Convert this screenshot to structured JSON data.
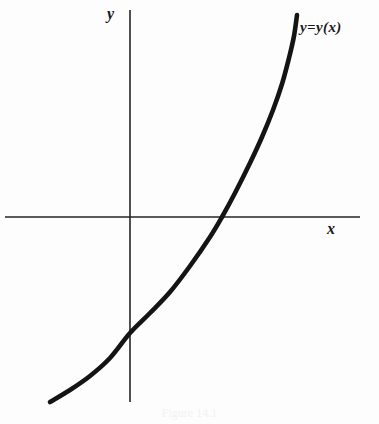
{
  "figure": {
    "background_color": "#fdfdfd",
    "ink_color": "#141414",
    "axis_color": "#242424",
    "axis_label_y": "y",
    "axis_label_x": "x",
    "curve_label": "y=y(x)",
    "caption": "Figure 14.1"
  },
  "chart_data": {
    "type": "line",
    "title": "",
    "subtitle": "",
    "xlabel": "x",
    "ylabel": "y",
    "annotations": [
      {
        "text": "y=y(x)",
        "x_px": 302,
        "y_px": 30,
        "describes": "curve"
      }
    ],
    "legend": [],
    "legend_position": "none",
    "grid": false,
    "axes": {
      "x_axis_px": {
        "y": 217,
        "x_start": 5,
        "x_end": 360
      },
      "y_axis_px": {
        "x": 130,
        "y_start": 10,
        "y_end": 402
      },
      "origin_px": {
        "x": 130,
        "y": 217
      },
      "x_axis_visible": true,
      "y_axis_visible": true,
      "tick_labels_x": [],
      "tick_labels_y": []
    },
    "series": [
      {
        "name": "y=y(x)",
        "style": "solid",
        "color": "#141414",
        "width_px": 4.6,
        "description": "Smooth monotonically increasing convex curve resembling an exponential shifted downward; negative for x below the root, crossing the x-axis once.",
        "points_px": [
          [
            50,
            402
          ],
          [
            70,
            390
          ],
          [
            90,
            376
          ],
          [
            110,
            358
          ],
          [
            130,
            333
          ],
          [
            150,
            313
          ],
          [
            170,
            292
          ],
          [
            190,
            266
          ],
          [
            210,
            237
          ],
          [
            222,
            217
          ],
          [
            235,
            193
          ],
          [
            250,
            163
          ],
          [
            262,
            137
          ],
          [
            273,
            110
          ],
          [
            282,
            84
          ],
          [
            289,
            58
          ],
          [
            294,
            36
          ],
          [
            297,
            15
          ]
        ],
        "x_intercept_px": 222,
        "y_intercept_px": 333
      }
    ]
  }
}
